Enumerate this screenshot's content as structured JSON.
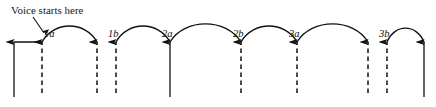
{
  "figure": {
    "width": 436,
    "height": 107,
    "background": "#ffffff",
    "ink_color": "#121212",
    "annotation": {
      "text": "Voice starts here",
      "x": 11,
      "y": 5,
      "leader_from": [
        33,
        17
      ],
      "leader_to": [
        44,
        33
      ]
    },
    "baseline_y": 97,
    "top_y": 42,
    "arrows": [
      {
        "id": "arrow-0",
        "x": 14,
        "style": "solid",
        "bottom_y": 97,
        "tip_y": 42
      },
      {
        "id": "arrow-1",
        "x": 42,
        "style": "dashed",
        "bottom_y": 93,
        "tip_y": 42,
        "label": "1a"
      },
      {
        "id": "arrow-2",
        "x": 97,
        "style": "dashed",
        "bottom_y": 93,
        "tip_y": 42
      },
      {
        "id": "arrow-3",
        "x": 116,
        "style": "dashed",
        "bottom_y": 93,
        "tip_y": 42,
        "label": "1b"
      },
      {
        "id": "arrow-4",
        "x": 170,
        "style": "solid",
        "bottom_y": 97,
        "tip_y": 42,
        "label": "2a"
      },
      {
        "id": "arrow-5",
        "x": 241,
        "style": "dashed",
        "bottom_y": 93,
        "tip_y": 42,
        "label": "2b"
      },
      {
        "id": "arrow-6",
        "x": 297,
        "style": "dashed",
        "bottom_y": 93,
        "tip_y": 42,
        "label": "3a"
      },
      {
        "id": "arrow-7",
        "x": 368,
        "style": "dashed",
        "bottom_y": 93,
        "tip_y": 42
      },
      {
        "id": "arrow-8",
        "x": 387,
        "style": "dashed",
        "bottom_y": 93,
        "tip_y": 42,
        "label": "3b"
      },
      {
        "id": "arrow-9",
        "x": 424,
        "style": "solid",
        "bottom_y": 97,
        "tip_y": 42
      }
    ],
    "spans": [
      {
        "id": "span-0",
        "from": 14,
        "to": 42,
        "shape": "flat",
        "apex_y": 42
      },
      {
        "id": "span-1",
        "from": 42,
        "to": 97,
        "shape": "arc",
        "apex_y": 27
      },
      {
        "id": "span-2",
        "from": 116,
        "to": 170,
        "shape": "arc",
        "apex_y": 27
      },
      {
        "id": "span-3",
        "from": 170,
        "to": 241,
        "shape": "arc",
        "apex_y": 25
      },
      {
        "id": "span-4",
        "from": 241,
        "to": 297,
        "shape": "arc",
        "apex_y": 27
      },
      {
        "id": "span-5",
        "from": 297,
        "to": 368,
        "shape": "arc",
        "apex_y": 25
      },
      {
        "id": "span-6",
        "from": 387,
        "to": 424,
        "shape": "arc",
        "apex_y": 29
      }
    ],
    "labels": [
      {
        "id": "label-1a",
        "text": "1a",
        "x": 44,
        "y": 29
      },
      {
        "id": "label-1b",
        "text": "1b",
        "x": 108,
        "y": 29
      },
      {
        "id": "label-2a",
        "text": "2a",
        "x": 162,
        "y": 29
      },
      {
        "id": "label-2b",
        "text": "2b",
        "x": 233,
        "y": 29
      },
      {
        "id": "label-3a",
        "text": "3a",
        "x": 289,
        "y": 29
      },
      {
        "id": "label-3b",
        "text": "3b",
        "x": 379,
        "y": 29
      }
    ]
  }
}
